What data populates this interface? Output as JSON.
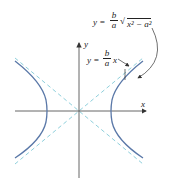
{
  "diagram": {
    "type": "hyperbola",
    "axes": {
      "x_label": "x",
      "y_label": "y"
    },
    "annotations": {
      "curve_equation": {
        "lhs": "y =",
        "num": "b",
        "den": "a",
        "radicand": "x² − a²"
      },
      "asymptote_equation": {
        "lhs": "y =",
        "num": "b",
        "den": "a",
        "rhs": "x"
      }
    },
    "colors": {
      "curve": "#5a78a8",
      "asymptote": "#8fd0dc",
      "axis": "#555555"
    }
  }
}
